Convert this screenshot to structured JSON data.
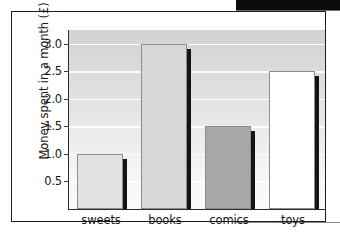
{
  "chart_data": {
    "type": "bar",
    "title": "",
    "xlabel": "",
    "ylabel": "Money spent in a month (£)",
    "categories": [
      "sweets",
      "books",
      "comics",
      "toys"
    ],
    "values": [
      1.0,
      3.0,
      1.5,
      2.5
    ],
    "series": [
      {
        "name": "Money spent",
        "values": [
          1.0,
          3.0,
          1.5,
          2.5
        ]
      }
    ],
    "ylim": [
      0,
      3.25
    ],
    "yticks": [
      0.5,
      1.0,
      1.5,
      2.0,
      2.5,
      3.0
    ],
    "ytick_labels": [
      "0.5",
      "1.0",
      "1.5",
      "2.0",
      "2.5",
      "3.0"
    ],
    "grid": "horizontal",
    "legend": "none",
    "bar_colors": [
      "#e2e2e2",
      "#d7d7d7",
      "#a8a8a8",
      "#ffffff"
    ],
    "bar_border_color": "#8d8d8d",
    "bar_shadow_color": "#141414",
    "axis_color": "#2b2b2b",
    "plot_background": "#e0e0e0",
    "gridline_color": "#fdfdfd",
    "text_color": "#161616"
  },
  "figure": {
    "frame_color": "#1c1c1c",
    "page_background": "#ffffff",
    "scan_bar_color": "#0b0b0b"
  }
}
